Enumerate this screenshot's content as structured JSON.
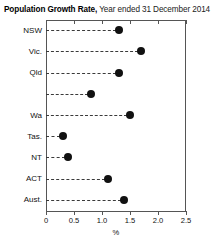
{
  "top_remnant": "·",
  "title": {
    "main": "Population Growth Rate,",
    "sub": " Year ended 31 December 2014"
  },
  "axis": {
    "x_title": "%",
    "tick_labels": [
      "0",
      "0.5",
      "1.0",
      "1.5",
      "2.0",
      "2.5"
    ]
  },
  "chart_data": {
    "type": "scatter",
    "title": "Population Growth Rate, Year ended 31 December 2014",
    "xlabel": "%",
    "ylabel": "",
    "xlim": [
      0,
      2.5
    ],
    "xticks": [
      0,
      0.5,
      1.0,
      1.5,
      2.0,
      2.5
    ],
    "grid": false,
    "legend": "none",
    "orientation": "horizontal",
    "marker": "filled-circle",
    "marker_color": "#111111",
    "leader_line": "dashed",
    "categories": [
      "NSW",
      "Vic.",
      "Qld",
      "",
      "Wa",
      "Tas.",
      "NT",
      "ACT",
      "Aust."
    ],
    "values": [
      1.3,
      1.7,
      1.3,
      0.8,
      1.5,
      0.3,
      0.4,
      1.1,
      1.4
    ]
  }
}
